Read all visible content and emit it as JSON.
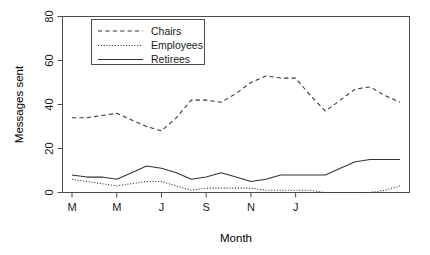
{
  "chart_data": {
    "type": "line",
    "title": "",
    "xlabel": "Month",
    "ylabel": "Messages sent",
    "ylim": [
      0,
      80
    ],
    "yticks": [
      0,
      20,
      40,
      60,
      80
    ],
    "ytick_labels": [
      "0",
      "20",
      "40",
      "60",
      "80"
    ],
    "grid": false,
    "legend_position": "top-left-inside",
    "x": [
      1,
      2,
      3,
      4,
      5,
      6,
      7,
      8,
      9,
      10,
      11,
      12,
      13,
      14,
      15,
      16,
      17,
      18,
      19,
      20,
      21,
      22,
      23
    ],
    "xtick_positions": [
      1,
      4,
      7,
      10,
      13,
      16
    ],
    "xtick_labels": [
      "M",
      "M",
      "J",
      "S",
      "N",
      "J"
    ],
    "series": [
      {
        "name": "Chairs",
        "style": "dashed",
        "color": "#333333",
        "values": [
          34,
          34,
          35,
          36,
          33,
          30,
          28,
          34,
          42,
          42,
          41,
          45,
          50,
          53,
          52,
          52,
          44,
          37,
          42,
          47,
          48,
          44,
          41
        ]
      },
      {
        "name": "Employees",
        "style": "dotted",
        "color": "#333333",
        "values": [
          6,
          5,
          4,
          3,
          4,
          5,
          5,
          3,
          1,
          2,
          2,
          2,
          2,
          1,
          1,
          1,
          1,
          0,
          0,
          0,
          0,
          1,
          3
        ]
      },
      {
        "name": "Retirees",
        "style": "solid",
        "color": "#333333",
        "values": [
          8,
          7,
          7,
          6,
          9,
          12,
          11,
          9,
          6,
          7,
          9,
          7,
          5,
          6,
          8,
          8,
          8,
          8,
          11,
          14,
          15,
          15,
          15
        ]
      }
    ]
  },
  "legend": {
    "entries": [
      {
        "label": "Chairs",
        "style": "dashed"
      },
      {
        "label": "Employees",
        "style": "dotted"
      },
      {
        "label": "Retirees",
        "style": "solid"
      }
    ]
  },
  "axes": {
    "y_title": "Messages sent",
    "x_title": "Month"
  }
}
